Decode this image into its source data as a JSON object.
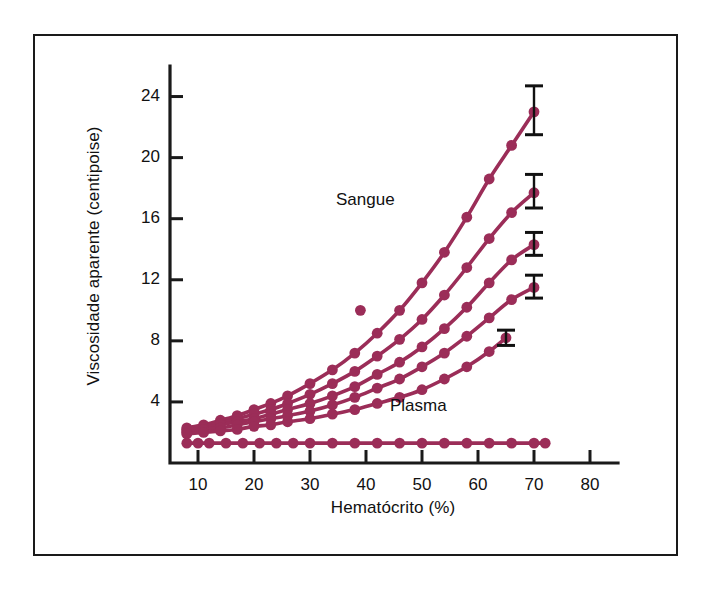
{
  "figure": {
    "background_color": "#ffffff",
    "frame_color": "#1a1a1a",
    "series_color": "#9b2d58",
    "errorbar_color": "#111111"
  },
  "chart_data": {
    "type": "scatter",
    "title": "",
    "subtitle": "",
    "xlabel": "Hematócrito (%)",
    "ylabel": "Viscosidade aparente (centipoise)",
    "xlim": [
      5,
      85
    ],
    "ylim": [
      0,
      26
    ],
    "xticks": [
      10,
      20,
      30,
      40,
      50,
      60,
      70,
      80
    ],
    "xtick_labels": [
      "10",
      "20",
      "30",
      "40",
      "50",
      "60",
      "70",
      "80"
    ],
    "yticks": [
      4,
      8,
      12,
      16,
      20,
      24
    ],
    "ytick_labels": [
      "4",
      "8",
      "12",
      "16",
      "20",
      "24"
    ],
    "grid": false,
    "legend_position": "inline-annotations",
    "annotations": [
      {
        "text": "Sangue",
        "x": 36,
        "y": 17.4
      },
      {
        "text": "Plasma",
        "x": 44,
        "y": 3.0
      }
    ],
    "series": [
      {
        "name": "Sangue curva 1",
        "marker": "filled-circle",
        "x": [
          8,
          11,
          14,
          17,
          20,
          23,
          26,
          30,
          34,
          38,
          42,
          46,
          50,
          54,
          58,
          62,
          66,
          70
        ],
        "y": [
          2.3,
          2.5,
          2.8,
          3.1,
          3.5,
          3.9,
          4.4,
          5.2,
          6.1,
          7.2,
          8.5,
          10.0,
          11.8,
          13.8,
          16.1,
          18.6,
          20.8,
          23.0
        ],
        "errorbar": {
          "x": 70,
          "y": 23.0,
          "lower": 1.5,
          "upper": 1.7
        }
      },
      {
        "name": "Sangue curva 2",
        "marker": "filled-circle",
        "x": [
          8,
          11,
          14,
          17,
          20,
          23,
          26,
          30,
          34,
          38,
          42,
          46,
          50,
          54,
          58,
          62,
          66,
          70
        ],
        "y": [
          2.2,
          2.4,
          2.6,
          2.9,
          3.2,
          3.5,
          3.9,
          4.5,
          5.2,
          6.0,
          7.0,
          8.1,
          9.4,
          11.0,
          12.8,
          14.7,
          16.4,
          17.7
        ],
        "errorbar": {
          "x": 70,
          "y": 17.7,
          "lower": 1.0,
          "upper": 1.2
        }
      },
      {
        "name": "Sangue curva 3",
        "marker": "filled-circle",
        "x": [
          8,
          11,
          14,
          17,
          20,
          23,
          26,
          30,
          34,
          38,
          42,
          46,
          50,
          54,
          58,
          62,
          66,
          70
        ],
        "y": [
          2.1,
          2.3,
          2.5,
          2.7,
          2.9,
          3.2,
          3.5,
          3.9,
          4.4,
          5.0,
          5.8,
          6.6,
          7.6,
          8.8,
          10.2,
          11.8,
          13.3,
          14.3
        ],
        "errorbar": {
          "x": 70,
          "y": 14.3,
          "lower": 0.7,
          "upper": 0.8
        }
      },
      {
        "name": "Sangue curva 4",
        "marker": "filled-circle",
        "x": [
          8,
          11,
          14,
          17,
          20,
          23,
          26,
          30,
          34,
          38,
          42,
          46,
          50,
          54,
          58,
          62,
          66,
          70
        ],
        "y": [
          2.0,
          2.2,
          2.3,
          2.5,
          2.7,
          2.9,
          3.1,
          3.4,
          3.8,
          4.3,
          4.9,
          5.5,
          6.3,
          7.2,
          8.3,
          9.5,
          10.7,
          11.5
        ],
        "errorbar": {
          "x": 70,
          "y": 11.5,
          "lower": 0.7,
          "upper": 0.8
        }
      },
      {
        "name": "Sangue curva 5",
        "marker": "filled-circle",
        "x": [
          8,
          11,
          14,
          17,
          20,
          23,
          26,
          30,
          34,
          38,
          42,
          46,
          50,
          54,
          58,
          62,
          65
        ],
        "y": [
          1.9,
          2.0,
          2.1,
          2.2,
          2.4,
          2.5,
          2.7,
          2.9,
          3.2,
          3.5,
          3.9,
          4.3,
          4.8,
          5.5,
          6.3,
          7.3,
          8.2
        ],
        "errorbar": {
          "x": 65,
          "y": 8.2,
          "lower": 0.5,
          "upper": 0.5
        }
      },
      {
        "name": "Plasma",
        "marker": "filled-circle",
        "x": [
          8,
          10,
          12,
          15,
          18,
          21,
          24,
          27,
          30,
          34,
          38,
          42,
          46,
          50,
          54,
          58,
          62,
          66,
          70,
          72
        ],
        "y": [
          1.3,
          1.3,
          1.3,
          1.3,
          1.3,
          1.3,
          1.3,
          1.3,
          1.3,
          1.3,
          1.3,
          1.3,
          1.3,
          1.3,
          1.3,
          1.3,
          1.3,
          1.3,
          1.3,
          1.3
        ],
        "errorbar": null
      }
    ],
    "outliers": [
      {
        "name": "ponto isolado",
        "x": 39,
        "y": 10.0
      }
    ]
  }
}
